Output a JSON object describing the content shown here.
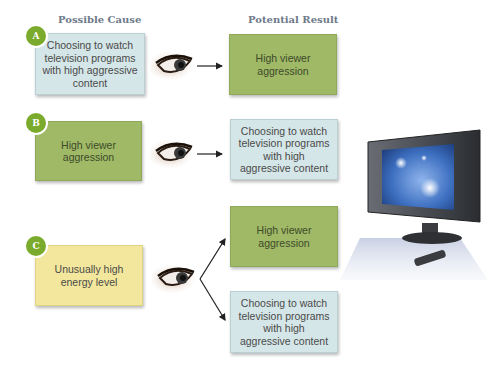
{
  "headers": {
    "cause": "Possible Cause",
    "result": "Potential Result"
  },
  "rows": [
    {
      "badge": "A",
      "cause": {
        "text": "Choosing to watch television programs with high aggressive content",
        "color": "#d5e6e8"
      },
      "results": [
        {
          "text": "High viewer aggression",
          "color": "#9fb966"
        }
      ]
    },
    {
      "badge": "B",
      "cause": {
        "text": "High viewer aggression",
        "color": "#9fb966"
      },
      "results": [
        {
          "text": "Choosing to watch television programs with high aggressive content",
          "color": "#d5e6e8"
        }
      ]
    },
    {
      "badge": "C",
      "cause": {
        "text": "Unusually high energy level",
        "color": "#f2e79c"
      },
      "results": [
        {
          "text": "High viewer aggression",
          "color": "#9fb966"
        },
        {
          "text": "Choosing to watch television programs with high aggressive content",
          "color": "#d5e6e8"
        }
      ]
    }
  ],
  "icons": {
    "eye": "eye-icon",
    "arrow": "arrow-right-icon",
    "tv": "television-icon",
    "remote": "remote-control-icon"
  },
  "colors": {
    "badge": "#7aab2c",
    "header": "#6e7a8a"
  }
}
